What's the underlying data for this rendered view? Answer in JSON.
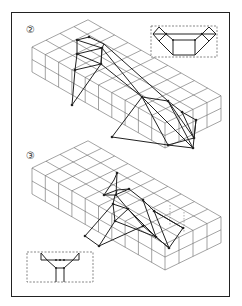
{
  "figure": {
    "panels": [
      {
        "id": "panel-2",
        "label": "②",
        "inset": "top-right",
        "description": "isometric grid block with two truss structures"
      },
      {
        "id": "panel-3",
        "label": "③",
        "inset": "bottom-left",
        "description": "isometric grid block with central truss structure"
      }
    ]
  },
  "colors": {
    "line": "#222222",
    "grid": "#666666",
    "frame": "#222222",
    "dashed": "#555555"
  }
}
